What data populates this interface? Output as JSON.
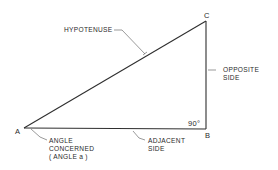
{
  "diagram": {
    "type": "right-triangle",
    "vertices": {
      "A": "A",
      "B": "B",
      "C": "C"
    },
    "labels": {
      "hypotenuse": "HYPOTENUSE",
      "opposite_line1": "OPPOSITE",
      "opposite_line2": "SIDE",
      "adjacent_line1": "ADJACENT",
      "adjacent_line2": "SIDE",
      "angle_line1": "ANGLE",
      "angle_line2": "CONCERNED",
      "angle_line3": "( ANGLE  a )",
      "right_angle": "90°"
    },
    "colors": {
      "line": "#2f2f2f",
      "text": "#2a2a2a",
      "background": "#ffffff"
    }
  }
}
